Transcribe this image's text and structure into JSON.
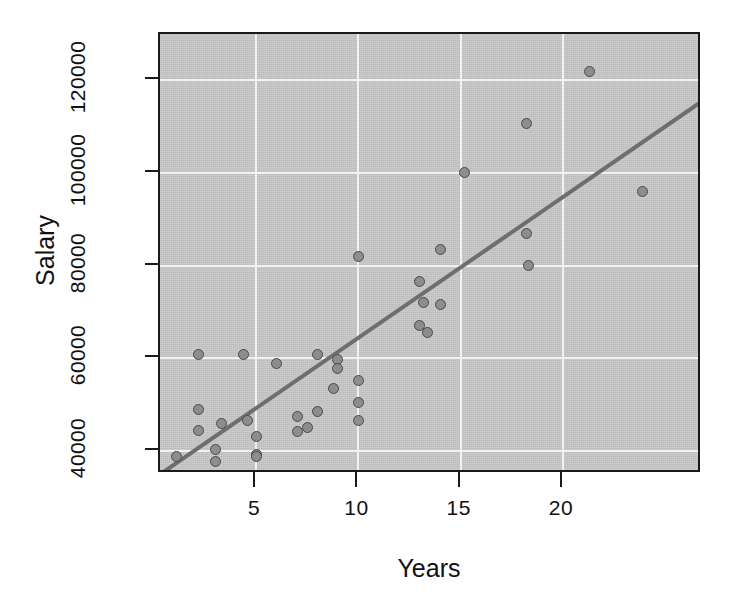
{
  "chart_data": {
    "type": "scatter",
    "title": "",
    "xlabel": "Years",
    "ylabel": "Salary",
    "xlim": [
      0.3,
      26.8
    ],
    "ylim": [
      35000,
      130000
    ],
    "xticks": [
      5,
      10,
      15,
      20
    ],
    "xtick_labels": [
      "5",
      "10",
      "15",
      "20"
    ],
    "yticks": [
      40000,
      60000,
      80000,
      100000,
      120000
    ],
    "ytick_labels": [
      "40000",
      "60000",
      "80000",
      "100000",
      "120000"
    ],
    "grid": true,
    "grid_color": "#f2f2f2",
    "panel_bg": "#c9c9c9",
    "point_fill": "#8d8d8d",
    "point_stroke": "#4a4a4a",
    "legend": "none",
    "x": [
      1.1,
      2.2,
      2.2,
      2.2,
      3.0,
      3.0,
      3.3,
      4.4,
      4.6,
      5.0,
      5.0,
      5.0,
      6.0,
      7.0,
      7.0,
      7.5,
      8.0,
      8.0,
      8.8,
      9.0,
      9.0,
      10.0,
      10.0,
      10.0,
      10.0,
      13.0,
      13.0,
      13.2,
      13.4,
      14.0,
      14.0,
      15.2,
      18.2,
      18.2,
      18.3,
      21.3,
      23.9
    ],
    "y": [
      38700,
      60900,
      48900,
      44500,
      40300,
      37600,
      46000,
      60900,
      46500,
      43000,
      39200,
      38800,
      58800,
      47500,
      44200,
      45000,
      60800,
      48500,
      53500,
      59700,
      57800,
      82000,
      55200,
      50500,
      46500,
      67000,
      76500,
      72000,
      65500,
      83500,
      71500,
      100000,
      110700,
      87000,
      80000,
      122000,
      95900
    ],
    "series": [
      {
        "name": "observations",
        "points": [
          {
            "x": 1.1,
            "y": 38700
          },
          {
            "x": 2.2,
            "y": 60900
          },
          {
            "x": 2.2,
            "y": 48900
          },
          {
            "x": 2.2,
            "y": 44500
          },
          {
            "x": 3.0,
            "y": 40300
          },
          {
            "x": 3.0,
            "y": 37600
          },
          {
            "x": 3.3,
            "y": 46000
          },
          {
            "x": 4.4,
            "y": 60900
          },
          {
            "x": 4.6,
            "y": 46500
          },
          {
            "x": 5.0,
            "y": 43000
          },
          {
            "x": 5.0,
            "y": 39200
          },
          {
            "x": 5.0,
            "y": 38800
          },
          {
            "x": 6.0,
            "y": 58800
          },
          {
            "x": 7.0,
            "y": 47500
          },
          {
            "x": 7.0,
            "y": 44200
          },
          {
            "x": 7.5,
            "y": 45000
          },
          {
            "x": 8.0,
            "y": 60800
          },
          {
            "x": 8.0,
            "y": 48500
          },
          {
            "x": 8.8,
            "y": 53500
          },
          {
            "x": 9.0,
            "y": 59700
          },
          {
            "x": 9.0,
            "y": 57800
          },
          {
            "x": 10.0,
            "y": 82000
          },
          {
            "x": 10.0,
            "y": 55200
          },
          {
            "x": 10.0,
            "y": 50500
          },
          {
            "x": 10.0,
            "y": 46500
          },
          {
            "x": 13.0,
            "y": 67000
          },
          {
            "x": 13.0,
            "y": 76500
          },
          {
            "x": 13.2,
            "y": 72000
          },
          {
            "x": 13.4,
            "y": 65500
          },
          {
            "x": 14.0,
            "y": 83500
          },
          {
            "x": 14.0,
            "y": 71500
          },
          {
            "x": 15.2,
            "y": 100000
          },
          {
            "x": 18.2,
            "y": 110700
          },
          {
            "x": 18.2,
            "y": 87000
          },
          {
            "x": 18.3,
            "y": 80000
          },
          {
            "x": 21.3,
            "y": 122000
          },
          {
            "x": 23.9,
            "y": 95900
          }
        ]
      }
    ],
    "trendline": {
      "type": "linear-regression",
      "color": "#6e6e6e",
      "x_start": 0.4,
      "y_start": 35250,
      "x_end": 26.8,
      "y_end": 115500
    }
  }
}
